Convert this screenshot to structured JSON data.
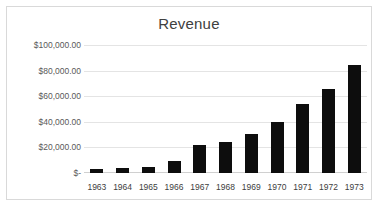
{
  "chart_data": {
    "type": "bar",
    "title": "Revenue",
    "xlabel": "",
    "ylabel": "",
    "categories": [
      "1963",
      "1964",
      "1965",
      "1966",
      "1967",
      "1968",
      "1969",
      "1970",
      "1971",
      "1972",
      "1973"
    ],
    "values": [
      3300,
      4100,
      5000,
      9000,
      22000,
      24000,
      30500,
      39500,
      54000,
      66000,
      84000
    ],
    "ylim": [
      0,
      100000
    ],
    "y_ticks": [
      0,
      20000,
      40000,
      60000,
      80000,
      100000
    ],
    "y_tick_labels": [
      "$-",
      "$20,000.00",
      "$40,000.00",
      "$60,000.00",
      "$80,000.00",
      "$100,000.00"
    ],
    "grid": true,
    "legend": "none",
    "bar_color": "#0d0d0d",
    "gridline_color": "#e4e4e4",
    "title_color": "#404040",
    "background": "#ffffff"
  }
}
